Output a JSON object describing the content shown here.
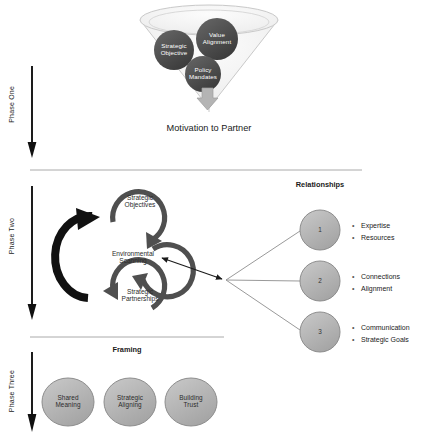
{
  "diagram": {
    "title_caption": "Motivation to Partner",
    "framing_label": "Framing",
    "relationships_label": "Relationships"
  },
  "phases": [
    {
      "id": "phase-one",
      "label": "Phase One"
    },
    {
      "id": "phase-two",
      "label": "Phase Two"
    },
    {
      "id": "phase-three",
      "label": "Phase Three"
    }
  ],
  "funnel": {
    "nodes": [
      {
        "id": "value-alignment",
        "line1": "Value",
        "line2": "Alignment"
      },
      {
        "id": "strategic-objective",
        "line1": "Strategic",
        "line2": "Objective"
      },
      {
        "id": "policy-mandates",
        "line1": "Policy",
        "line2": "Mandates"
      }
    ]
  },
  "cycle": {
    "nodes": [
      {
        "id": "strategic-objectives",
        "line1": "Strategic",
        "line2": "Objectives"
      },
      {
        "id": "environmental-scanning",
        "line1": "Environmental",
        "line2": "Scanning"
      },
      {
        "id": "strategic-partnerships",
        "line1": "Strategic",
        "line2": "Partnerships"
      }
    ]
  },
  "relationships": {
    "circles": [
      {
        "id": "relationship-1",
        "number": "1",
        "items": [
          "Expertise",
          "Resources"
        ]
      },
      {
        "id": "relationship-2",
        "number": "2",
        "items": [
          "Connections",
          "Alignment"
        ]
      },
      {
        "id": "relationship-3",
        "number": "3",
        "items": [
          "Communication",
          "Strategic Goals"
        ]
      }
    ]
  },
  "framing": {
    "nodes": [
      {
        "id": "shared-meaning",
        "line1": "Shared",
        "line2": "Meaning"
      },
      {
        "id": "strategic-aligning",
        "line1": "Strategic",
        "line2": "Aligning"
      },
      {
        "id": "building-trust",
        "line1": "Building",
        "line2": "Trust"
      }
    ]
  },
  "colors": {
    "dark_node": "#4a4a4a",
    "gray_node": "#b0b0b0",
    "funnel_fill": "#f2f2f2",
    "line": "#9a9a9a",
    "arrow_dark": "#1a1a1a",
    "arc": "#4f4f4f"
  }
}
